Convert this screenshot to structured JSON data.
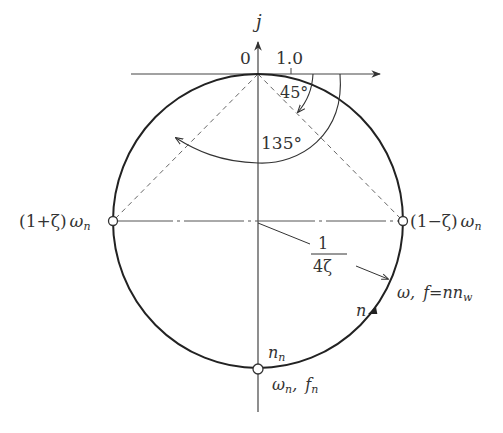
{
  "diagram": {
    "type": "frequency-locus-circle",
    "axes": {
      "vertical_label": "j",
      "origin_label": "0",
      "tick_label": "1.0"
    },
    "angles": {
      "small": "45°",
      "large": "135°"
    },
    "points": {
      "left": {
        "prefix": "(1+ζ)",
        "var": "ω",
        "sub": "n"
      },
      "right": {
        "prefix": "(1−ζ)",
        "var": "ω",
        "sub": "n"
      },
      "bottom_top_label": {
        "var": "n",
        "sub": "n"
      },
      "bottom_below_label": {
        "v1": "ω",
        "s1": "n",
        "sep": ",",
        "v2": "f",
        "s2": "n"
      }
    },
    "radius_label": {
      "numerator": "1",
      "denominator": "4ζ"
    },
    "locus_label": {
      "w": "ω,",
      "f": "f",
      "eq": "=",
      "nn": "nn",
      "sub": "w"
    },
    "direction_label": "n",
    "colors": {
      "line": "#333333",
      "dashed": "#666666",
      "circle": "#222222"
    }
  }
}
